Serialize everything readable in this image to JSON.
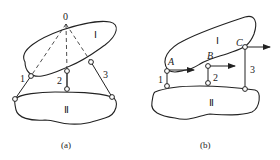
{
  "figure_a": {
    "pole_label": "0",
    "body1_label": "Ⅰ",
    "body2_label": "Ⅱ",
    "link_labels": [
      "1",
      "2",
      "3"
    ],
    "caption": "(a)"
  },
  "figure_b": {
    "body1_label": "Ⅰ",
    "body2_label": "Ⅱ",
    "point_labels": [
      "A",
      "B",
      "C"
    ],
    "link_labels": [
      "1",
      "2",
      "3"
    ],
    "caption": "(b)"
  },
  "colors": {
    "stroke": "#222222",
    "background": "#ffffff"
  }
}
